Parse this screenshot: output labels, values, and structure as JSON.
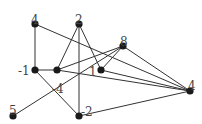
{
  "diagram": {
    "type": "graph",
    "nodes": [
      {
        "id": "n_top4",
        "label": "4",
        "x": 35,
        "y": 24,
        "lx": 31,
        "ly": 15
      },
      {
        "id": "n_2",
        "label": "2",
        "x": 79,
        "y": 24,
        "lx": 75,
        "ly": 15
      },
      {
        "id": "n_8",
        "label": "8",
        "x": 123,
        "y": 46,
        "lx": 120,
        "ly": 37
      },
      {
        "id": "n_m1",
        "label": "-1",
        "x": 35,
        "y": 70,
        "lx": 18,
        "ly": 66
      },
      {
        "id": "n_m4",
        "label": "-4",
        "x": 57,
        "y": 70,
        "lx": 52,
        "ly": 84
      },
      {
        "id": "n_1",
        "label": "1",
        "x": 101,
        "y": 70,
        "lx": 89,
        "ly": 67
      },
      {
        "id": "n_r4",
        "label": "4",
        "x": 190,
        "y": 91,
        "lx": 188,
        "ly": 81
      },
      {
        "id": "n_5",
        "label": "5",
        "x": 13,
        "y": 116,
        "lx": 9,
        "ly": 106
      },
      {
        "id": "n_m2",
        "label": "-2",
        "x": 79,
        "y": 116,
        "lx": 81,
        "ly": 107
      }
    ],
    "edges": [
      [
        "n_top4",
        "n_m1"
      ],
      [
        "n_top4",
        "n_r4"
      ],
      [
        "n_2",
        "n_m4"
      ],
      [
        "n_2",
        "n_1"
      ],
      [
        "n_2",
        "n_m2"
      ],
      [
        "n_m1",
        "n_m4"
      ],
      [
        "n_m1",
        "n_m2"
      ],
      [
        "n_m4",
        "n_8"
      ],
      [
        "n_m4",
        "n_r4"
      ],
      [
        "n_1",
        "n_8"
      ],
      [
        "n_1",
        "n_r4"
      ],
      [
        "n_8",
        "n_r4"
      ],
      [
        "n_5",
        "n_8"
      ],
      [
        "n_m2",
        "n_r4"
      ]
    ]
  }
}
